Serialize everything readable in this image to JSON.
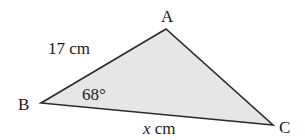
{
  "diagram": {
    "type": "triangle",
    "fill_color": "#e6e6e6",
    "stroke_color": "#2a2a2a",
    "vertices": [
      {
        "name": "A",
        "x": 166,
        "y": 29
      },
      {
        "name": "B",
        "x": 41,
        "y": 103
      },
      {
        "name": "C",
        "x": 273,
        "y": 125
      }
    ],
    "labels": {
      "A": "A",
      "B": "B",
      "C": "C",
      "side_AB": "17 cm",
      "angle_B": "68°",
      "side_BC_var": "x",
      "side_BC_unit": " cm"
    }
  }
}
